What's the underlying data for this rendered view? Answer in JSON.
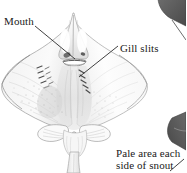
{
  "figure": {
    "kind": "scientific-illustration",
    "background_color": "#ffffff",
    "ink_color": "#1a1a1a"
  },
  "labels": {
    "mouth": "Mouth",
    "gill_slits": "Gill slits",
    "pale_area_line1": "Pale area each",
    "pale_area_line2": "side of snout"
  },
  "colors": {
    "text": "#1a1a1a",
    "leader_line": "#2b2b2b",
    "body_outline": "#8d8d8d",
    "body_fill_light": "#fbfbfb",
    "body_fill_mid": "#ededed",
    "body_shadow": "#d6d6d6",
    "speckle": "#b8b8b8",
    "mouth_dark": "#5a5a5a",
    "corner_fin_dark": "#555555",
    "corner_fin_mid": "#6e6e6e"
  },
  "annotations": [
    {
      "name": "mouth",
      "leader_from": [
        34,
        26
      ],
      "leader_to": [
        74,
        58
      ]
    },
    {
      "name": "gill-slits",
      "leader_from": [
        118,
        46
      ],
      "leader_to": [
        80,
        76
      ]
    },
    {
      "name": "pale-area",
      "leader_from": [
        172,
        170
      ],
      "leader_to": [
        183,
        160
      ]
    }
  ]
}
